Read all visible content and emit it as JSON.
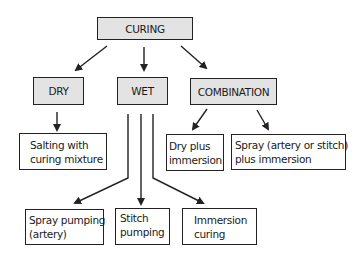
{
  "diagram": {
    "title": "CURING",
    "categories": [
      {
        "label": "DRY"
      },
      {
        "label": "WET"
      },
      {
        "label": "COMBINATION"
      }
    ],
    "dry_methods": [
      {
        "line1": "Salting with",
        "line2": "curing mixture"
      }
    ],
    "combination_methods": [
      {
        "line1": "Dry plus",
        "line2": "immersion"
      },
      {
        "line1": "Spray (artery or stitch)",
        "line2": "plus immersion"
      }
    ],
    "wet_methods": [
      {
        "line1": "Spray pumping",
        "line2": "(artery)"
      },
      {
        "line1": "Stitch",
        "line2": "pumping"
      },
      {
        "line1": "Immersion",
        "line2": "curing"
      }
    ],
    "colors": {
      "box_fill_gray": "#e3e3e3",
      "box_fill_white": "#ffffff",
      "stroke": "#222222"
    }
  }
}
